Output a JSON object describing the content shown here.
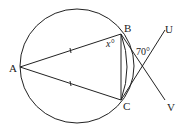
{
  "diagram": {
    "type": "geometry",
    "points": {
      "A": {
        "label": "A",
        "x": 20,
        "y": 67
      },
      "B": {
        "label": "B",
        "x": 121,
        "y": 34
      },
      "C": {
        "label": "C",
        "x": 121,
        "y": 100
      },
      "U": {
        "label": "U",
        "x": 165,
        "y": 30
      },
      "V": {
        "label": "V",
        "x": 165,
        "y": 100
      }
    },
    "circle": {
      "cx": 77,
      "cy": 66,
      "r": 57
    },
    "angles": {
      "x_label": "x°",
      "angle_70_label": "70°"
    },
    "segments": [
      "AB",
      "AC",
      "BC",
      "CU",
      "BV"
    ],
    "equal_marks": [
      "AB",
      "AC"
    ],
    "stroke_color": "#222222"
  }
}
